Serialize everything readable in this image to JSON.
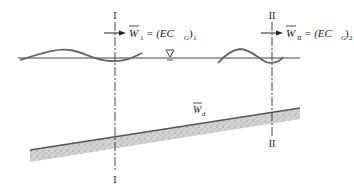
{
  "diagram": {
    "sections": [
      {
        "id": "I",
        "top_label": "I",
        "bottom_label": "I"
      },
      {
        "id": "II",
        "top_label": "II",
        "bottom_label": "II"
      }
    ],
    "flux_labels": {
      "section_1": {
        "symbol": "W",
        "subscript": "1",
        "rhs": "= (EC",
        "rhs_sub": "G",
        "rhs_close": ")",
        "rhs_close_sub": "1"
      },
      "section_2": {
        "symbol": "W",
        "subscript": "II",
        "rhs": "= (EC",
        "rhs_sub": "G",
        "rhs_close": ")",
        "rhs_close_sub": "2"
      }
    },
    "bed_label": {
      "symbol": "W",
      "subscript": "d"
    },
    "water_surface_icon": "inverted-triangle",
    "colors": {
      "lines": "#333333",
      "wave": "#555555",
      "bed_fill": "#cfcfcf",
      "bed_edge": "#555555"
    }
  }
}
